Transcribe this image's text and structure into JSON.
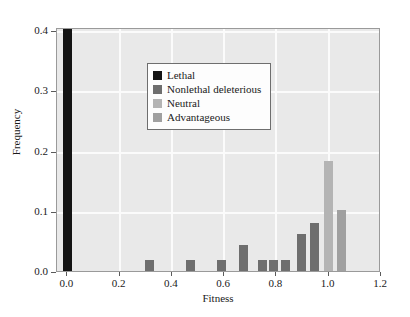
{
  "chart_data": {
    "type": "bar",
    "title": "",
    "xlabel": "Fitness",
    "ylabel": "Frequency",
    "xlim": [
      -0.04,
      1.2
    ],
    "ylim": [
      0.0,
      0.405
    ],
    "xticks": [
      "0.0",
      "0.2",
      "0.4",
      "0.6",
      "0.8",
      "1.0",
      "1.2"
    ],
    "xtick_values": [
      0.0,
      0.2,
      0.4,
      0.6,
      0.8,
      1.0,
      1.2
    ],
    "yticks": [
      "0.0",
      "0.1",
      "0.2",
      "0.3",
      "0.4"
    ],
    "ytick_values": [
      0.0,
      0.1,
      0.2,
      0.3,
      0.4
    ],
    "grid": true,
    "legend_position": "upper center",
    "bin_width": 0.034,
    "categories": [
      "Lethal",
      "Nonlethal deleterious",
      "Neutral",
      "Advantageous"
    ],
    "colors": {
      "lethal": "#141414",
      "nonlethal_deleterious": "#6e6e6e",
      "neutral": "#b4b4b4",
      "advantageous": "#a0a0a0",
      "plot_background": "#e9e9e9",
      "gridline": "#fbfbfb",
      "frame": "#9a9a9a"
    },
    "bars": [
      {
        "x": 0.0,
        "value": 0.405,
        "category": "Lethal"
      },
      {
        "x": 0.315,
        "value": 0.018,
        "category": "Nonlethal deleterious"
      },
      {
        "x": 0.47,
        "value": 0.018,
        "category": "Nonlethal deleterious"
      },
      {
        "x": 0.59,
        "value": 0.018,
        "category": "Nonlethal deleterious"
      },
      {
        "x": 0.675,
        "value": 0.043,
        "category": "Nonlethal deleterious"
      },
      {
        "x": 0.745,
        "value": 0.018,
        "category": "Nonlethal deleterious"
      },
      {
        "x": 0.79,
        "value": 0.018,
        "category": "Nonlethal deleterious"
      },
      {
        "x": 0.835,
        "value": 0.018,
        "category": "Nonlethal deleterious"
      },
      {
        "x": 0.895,
        "value": 0.062,
        "category": "Nonlethal deleterious"
      },
      {
        "x": 0.945,
        "value": 0.08,
        "category": "Nonlethal deleterious"
      },
      {
        "x": 1.0,
        "value": 0.183,
        "category": "Neutral"
      },
      {
        "x": 1.05,
        "value": 0.101,
        "category": "Advantageous"
      }
    ],
    "legend": [
      {
        "label": "Lethal",
        "color": "#141414"
      },
      {
        "label": "Nonlethal deleterious",
        "color": "#6e6e6e"
      },
      {
        "label": "Neutral",
        "color": "#b4b4b4"
      },
      {
        "label": "Advantageous",
        "color": "#a0a0a0"
      }
    ]
  }
}
